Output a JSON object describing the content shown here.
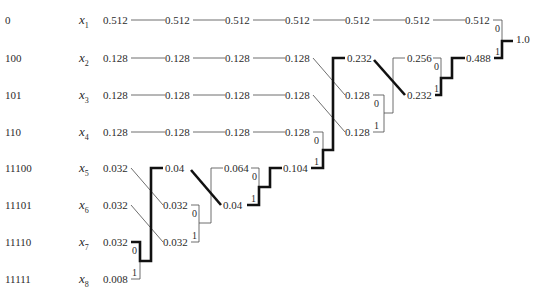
{
  "diagram": {
    "title": "",
    "type": "huffman-coding-tree",
    "symbols": [
      {
        "code": "0",
        "name": "x",
        "sub": "1",
        "prob": "0.512"
      },
      {
        "code": "100",
        "name": "x",
        "sub": "2",
        "prob": "0.128"
      },
      {
        "code": "101",
        "name": "x",
        "sub": "3",
        "prob": "0.128"
      },
      {
        "code": "110",
        "name": "x",
        "sub": "4",
        "prob": "0.128"
      },
      {
        "code": "11100",
        "name": "x",
        "sub": "5",
        "prob": "0.032"
      },
      {
        "code": "11101",
        "name": "x",
        "sub": "6",
        "prob": "0.032"
      },
      {
        "code": "11110",
        "name": "x",
        "sub": "7",
        "prob": "0.032"
      },
      {
        "code": "11111",
        "name": "x",
        "sub": "8",
        "prob": "0.008"
      }
    ],
    "stages": [
      {
        "probs": [
          "0.512",
          "0.128",
          "0.128",
          "0.128",
          "0.032",
          "0.032",
          "0.032",
          "0.008"
        ]
      },
      {
        "probs": [
          "0.512",
          "0.128",
          "0.128",
          "0.128",
          "0.04",
          "0.032",
          "0.032"
        ]
      },
      {
        "probs": [
          "0.512",
          "0.128",
          "0.128",
          "0.128",
          "0.064",
          "0.04"
        ]
      },
      {
        "probs": [
          "0.512",
          "0.128",
          "0.128",
          "0.128",
          "0.104"
        ]
      },
      {
        "probs": [
          "0.512",
          "0.232",
          "0.128",
          "0.128"
        ]
      },
      {
        "probs": [
          "0.512",
          "0.256",
          "0.232"
        ]
      },
      {
        "probs": [
          "0.512",
          "0.488"
        ]
      },
      {
        "probs": [
          "1.0"
        ]
      }
    ],
    "bit_labels": {
      "zero": "0",
      "one": "1"
    },
    "labels": {
      "r1": [
        "0.512",
        "0.512",
        "0.512",
        "0.512",
        "0.512",
        "0.512",
        "0.512"
      ],
      "r2": [
        "0.128",
        "0.128",
        "0.128",
        "0.128",
        "0.232",
        "0.256",
        "0.488"
      ],
      "r3": [
        "0.128",
        "0.128",
        "0.128",
        "0.128",
        "0.128",
        "0.232"
      ],
      "r4": [
        "0.128",
        "0.128",
        "0.128",
        "0.128",
        "0.128"
      ],
      "r5": [
        "0.032",
        "0.04",
        "0.064",
        "0.104"
      ],
      "r6": [
        "0.032",
        "0.032",
        "0.04"
      ],
      "r7": [
        "0.032",
        "0.032"
      ],
      "r8": [
        "0.008"
      ],
      "root": "1.0"
    }
  }
}
